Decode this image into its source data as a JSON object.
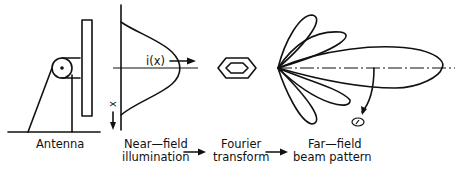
{
  "diagram": {
    "stages": [
      {
        "id": "antenna",
        "label_lines": [
          "Antenna"
        ]
      },
      {
        "id": "near-field",
        "label_lines": [
          "Near—field",
          "illumination"
        ]
      },
      {
        "id": "fourier",
        "label_lines": [
          "Fourier",
          "transform"
        ]
      },
      {
        "id": "far-field",
        "label_lines": [
          "Far—field",
          "beam pattern"
        ]
      }
    ],
    "illumination_label": "i(x)",
    "axis_label": "x",
    "angle_label": "θ",
    "colors": {
      "ink": "#111111",
      "background": "#ffffff"
    }
  }
}
